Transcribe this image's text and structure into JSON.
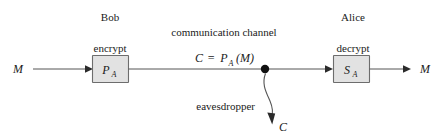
{
  "diagram": {
    "sender": {
      "party_label": "Bob",
      "operation_label": "encrypt",
      "box_symbol": "P",
      "box_subscript": "A"
    },
    "receiver": {
      "party_label": "Alice",
      "operation_label": "decrypt",
      "box_symbol": "S",
      "box_subscript": "A"
    },
    "channel": {
      "label": "communication channel",
      "formula_lhs": "C",
      "formula_eq": "=",
      "formula_rhs_symbol": "P",
      "formula_rhs_subscript": "A",
      "formula_rhs_arg": "(M)"
    },
    "attacker": {
      "label": "eavesdropper",
      "captured_symbol": "C"
    },
    "plaintext_in": "M",
    "plaintext_out": "M",
    "colors": {
      "box_fill": "#e2e2e2",
      "box_stroke": "#6d6d6d",
      "wire": "#555555",
      "text": "#1a1a1a",
      "background": "#ffffff"
    }
  }
}
